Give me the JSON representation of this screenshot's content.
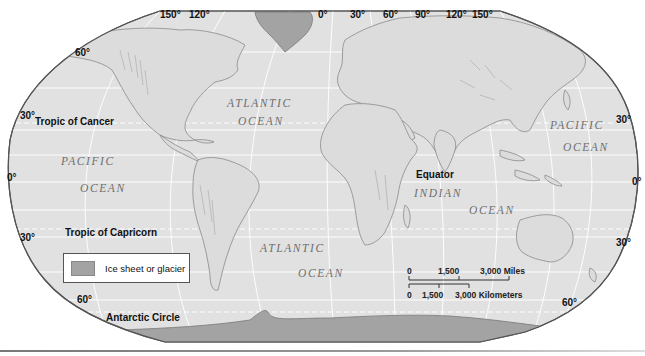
{
  "map": {
    "projection": "Robinson-style world physical map",
    "colors": {
      "ocean": "#e1e1e1",
      "land": "#dcdcdc",
      "coast": "#8a8a8a",
      "ice": "#a3a3a3",
      "graticule": "#ffffff",
      "border": "#555555"
    },
    "longitude_labels_top": [
      "150°",
      "120°",
      "0°",
      "30°",
      "60°",
      "90°",
      "120°",
      "150°"
    ],
    "latitude_labels_left": {
      "lat60": "60°",
      "lat30n": "30°",
      "lat0": "0°",
      "lat30s": "30°",
      "lat60s": "60°"
    },
    "latitude_labels_right": {
      "lat30n": "30°",
      "lat0": "0°",
      "lat30s": "30°",
      "lat60s": "60°"
    },
    "lines": {
      "tropic_cancer": "Tropic of Cancer",
      "equator": "Equator",
      "tropic_capricorn": "Tropic of Capricorn",
      "antarctic_circle": "Antarctic Circle"
    },
    "oceans": {
      "atlantic_north": {
        "line1": "ATLANTIC",
        "line2": "OCEAN"
      },
      "pacific_west": {
        "line1": "PACIFIC",
        "line2": "OCEAN"
      },
      "pacific_east": {
        "line1": "PACIFIC",
        "line2": "OCEAN"
      },
      "indian": {
        "line1": "INDIAN",
        "line2": "OCEAN"
      },
      "atlantic_south": {
        "line1": "ATLANTIC",
        "line2": "OCEAN"
      }
    },
    "legend": {
      "items": [
        {
          "label": "Ice sheet or glacier",
          "color": "#a3a3a3"
        }
      ]
    },
    "scale_bar": {
      "miles": {
        "ticks": [
          "0",
          "1,500",
          "3,000 Miles"
        ]
      },
      "kilometers": {
        "ticks": [
          "0",
          "1,500",
          "3,000 Kilometers"
        ]
      }
    }
  }
}
